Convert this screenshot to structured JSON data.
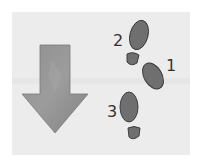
{
  "illustration": {
    "description": "Down arrow beside numbered footprints",
    "background_color": "#ececec",
    "arrow": {
      "direction": "down",
      "color": "#8a8a8a"
    },
    "footprints": [
      {
        "label": "1",
        "color": "#6f6f6f"
      },
      {
        "label": "2",
        "color": "#6f6f6f"
      },
      {
        "label": "3",
        "color": "#6f6f6f"
      }
    ]
  }
}
